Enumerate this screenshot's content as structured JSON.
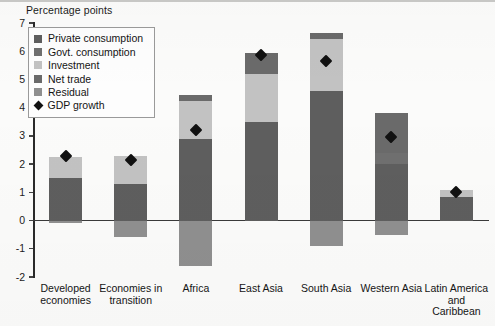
{
  "chart_data": {
    "type": "bar",
    "title": "",
    "ylabel": "Percentage points",
    "xlabel": "",
    "ylim": [
      -2,
      7
    ],
    "yticks": [
      -2,
      -1,
      0,
      1,
      2,
      3,
      4,
      5,
      6,
      7
    ],
    "grid": false,
    "stacked": true,
    "legend_position": "top-left",
    "categories": [
      "Developed economies",
      "Economies in transition",
      "Africa",
      "East Asia",
      "South Asia",
      "Western Asia",
      "Latin America and Caribbean"
    ],
    "series": [
      {
        "name": "Private consumption",
        "color": "#5e5e5e",
        "values": [
          1.5,
          1.3,
          2.9,
          3.5,
          4.6,
          2.0,
          0.85
        ]
      },
      {
        "name": "Govt. consumption",
        "color": "#6f6f6f",
        "values": [
          0.0,
          0.0,
          0.0,
          0.0,
          0.0,
          0.4,
          0.0
        ]
      },
      {
        "name": "Investment",
        "color": "#c2c2c2",
        "values": [
          0.75,
          1.0,
          1.35,
          1.7,
          1.85,
          0.0,
          0.25
        ]
      },
      {
        "name": "Net trade",
        "color": "#6a6a6a",
        "values": [
          0.0,
          0.0,
          0.2,
          0.75,
          0.2,
          1.4,
          0.0
        ]
      },
      {
        "name": "Residual",
        "color": "#8f8f8f",
        "values": [
          -0.1,
          -0.6,
          -1.6,
          0.0,
          -0.9,
          -0.5,
          0.0
        ]
      }
    ],
    "markers": {
      "name": "GDP growth",
      "color": "#111111",
      "marker": "diamond",
      "values": [
        2.3,
        2.15,
        3.2,
        5.85,
        5.65,
        2.95,
        1.0
      ]
    }
  },
  "legend": {
    "items": [
      {
        "label": "Private consumption",
        "swatch": "#5e5e5e",
        "glyph": "square"
      },
      {
        "label": "Govt. consumption",
        "swatch": "#6f6f6f",
        "glyph": "square"
      },
      {
        "label": "Investment",
        "swatch": "#c2c2c2",
        "glyph": "square"
      },
      {
        "label": "Net trade",
        "swatch": "#6a6a6a",
        "glyph": "square"
      },
      {
        "label": "Residual",
        "swatch": "#8f8f8f",
        "glyph": "square"
      },
      {
        "label": "GDP growth",
        "swatch": "#111111",
        "glyph": "diamond"
      }
    ]
  },
  "axis": {
    "y_title": "Percentage points",
    "y_tick_labels": [
      "7",
      "6",
      "5",
      "4",
      "3",
      "2",
      "1",
      "0",
      "-1",
      "-2"
    ]
  },
  "x_labels": [
    {
      "lines": [
        "Developed",
        "economies"
      ]
    },
    {
      "lines": [
        "Economies in",
        "transition"
      ]
    },
    {
      "lines": [
        "Africa"
      ]
    },
    {
      "lines": [
        "East Asia"
      ]
    },
    {
      "lines": [
        "South Asia"
      ]
    },
    {
      "lines": [
        "Western Asia"
      ]
    },
    {
      "lines": [
        "Latin America",
        "and",
        "Caribbean"
      ]
    }
  ]
}
